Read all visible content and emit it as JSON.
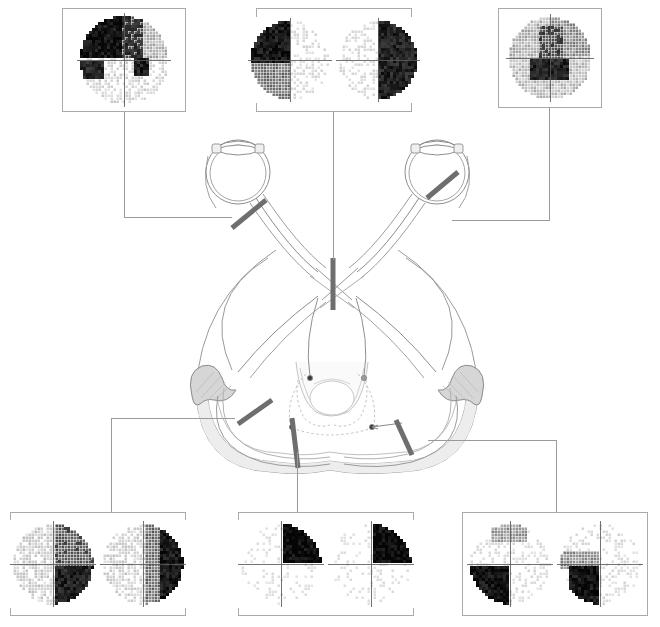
{
  "figure": {
    "background_color": "#ffffff",
    "line_color": "#808080",
    "lesion_color": "#6e6e6e",
    "box_border_color": "#a9a9a9",
    "connector_color": "#9a9a9a",
    "lgn_fill": "#d4d4d4"
  },
  "anatomy": {
    "structures": [
      {
        "name": "left-eye",
        "label": "Left eye"
      },
      {
        "name": "right-eye",
        "label": "Right eye"
      },
      {
        "name": "left-optic-nerve",
        "label": "Left optic nerve"
      },
      {
        "name": "right-optic-nerve",
        "label": "Right optic nerve"
      },
      {
        "name": "optic-chiasm",
        "label": "Optic chiasm"
      },
      {
        "name": "left-optic-tract",
        "label": "Left optic tract"
      },
      {
        "name": "right-optic-tract",
        "label": "Right optic tract"
      },
      {
        "name": "left-lateral-geniculate-nucleus",
        "label": "Left LGN"
      },
      {
        "name": "right-lateral-geniculate-nucleus",
        "label": "Right LGN"
      },
      {
        "name": "left-optic-radiation",
        "label": "Left optic radiation"
      },
      {
        "name": "right-optic-radiation",
        "label": "Right optic radiation"
      },
      {
        "name": "midbrain",
        "label": "Midbrain"
      },
      {
        "name": "occipital-cortex",
        "label": "Occipital cortex"
      },
      {
        "name": "pretectal-nucleus-left",
        "label": "Left pretectal nucleus"
      },
      {
        "name": "pretectal-nucleus-right",
        "label": "Right pretectal nucleus"
      }
    ]
  },
  "lesions": [
    {
      "id": "lesion-1",
      "site": "left-optic-nerve",
      "defect": "left-monocular-field-loss"
    },
    {
      "id": "lesion-2",
      "site": "optic-chiasm",
      "defect": "bitemporal-hemianopia"
    },
    {
      "id": "lesion-3",
      "site": "right-optic-nerve",
      "defect": "right-monocular-field-loss"
    },
    {
      "id": "lesion-4",
      "site": "left-optic-tract",
      "defect": "right-homonymous-hemianopia"
    },
    {
      "id": "lesion-5",
      "site": "left-temporal-optic-radiation",
      "defect": "right-superior-homonymous-quadrantanopia"
    },
    {
      "id": "lesion-6",
      "site": "right-parietal-optic-radiation",
      "defect": "left-inferior-homonymous-quadrantanopia"
    }
  ],
  "field_boxes": [
    {
      "id": "vf-top-left",
      "name": "visual-field-left-optic-nerve-lesion",
      "lesion_ref": "lesion-1",
      "x": 62,
      "y": 8,
      "width": 124,
      "height": 104,
      "eyes": [
        {
          "eye": "left",
          "pattern": "superior-altitudinal-arcuate",
          "size": 96
        }
      ]
    },
    {
      "id": "vf-top-center",
      "name": "visual-field-chiasm-lesion",
      "lesion_ref": "lesion-2",
      "x": 256,
      "y": 8,
      "width": 156,
      "height": 104,
      "eyes": [
        {
          "eye": "left",
          "pattern": "temporal-left-hemi",
          "size": 86
        },
        {
          "eye": "right",
          "pattern": "temporal-right-hemi",
          "size": 86
        }
      ]
    },
    {
      "id": "vf-top-right",
      "name": "visual-field-right-optic-nerve-lesion",
      "lesion_ref": "lesion-3",
      "x": 498,
      "y": 8,
      "width": 104,
      "height": 100,
      "eyes": [
        {
          "eye": "right",
          "pattern": "central-patchy-scotoma",
          "size": 90
        }
      ]
    },
    {
      "id": "vf-bottom-left",
      "name": "visual-field-optic-tract-lesion",
      "lesion_ref": "lesion-4",
      "x": 10,
      "y": 512,
      "width": 176,
      "height": 104,
      "eyes": [
        {
          "eye": "left",
          "pattern": "right-hemi-incongruous",
          "size": 88
        },
        {
          "eye": "right",
          "pattern": "right-hemi-incongruous2",
          "size": 88
        }
      ]
    },
    {
      "id": "vf-bottom-center",
      "name": "visual-field-temporal-radiation-lesion",
      "lesion_ref": "lesion-5",
      "x": 238,
      "y": 512,
      "width": 176,
      "height": 104,
      "eyes": [
        {
          "eye": "left",
          "pattern": "superior-right-quadrant",
          "size": 88
        },
        {
          "eye": "right",
          "pattern": "superior-right-quadrant",
          "size": 88
        }
      ]
    },
    {
      "id": "vf-bottom-right",
      "name": "visual-field-parietal-radiation-lesion",
      "lesion_ref": "lesion-6",
      "x": 462,
      "y": 512,
      "width": 186,
      "height": 104,
      "eyes": [
        {
          "eye": "left",
          "pattern": "inferior-left-quadrant",
          "size": 88
        },
        {
          "eye": "right",
          "pattern": "inferior-left-quadrant2",
          "size": 88
        }
      ]
    }
  ],
  "connectors": [
    {
      "name": "connector-top-left",
      "segments": [
        {
          "type": "v",
          "x": 124,
          "y": 112,
          "length": 105
        },
        {
          "type": "h",
          "x": 124,
          "y": 217,
          "length": 108
        }
      ]
    },
    {
      "name": "connector-top-center",
      "segments": [
        {
          "type": "v",
          "x": 333,
          "y": 112,
          "length": 148
        }
      ]
    },
    {
      "name": "connector-top-right",
      "segments": [
        {
          "type": "v",
          "x": 549,
          "y": 108,
          "length": 112
        },
        {
          "type": "h",
          "x": 452,
          "y": 220,
          "length": 98
        }
      ]
    },
    {
      "name": "connector-bottom-left",
      "segments": [
        {
          "type": "h",
          "x": 111,
          "y": 418,
          "length": 124
        },
        {
          "type": "v",
          "x": 111,
          "y": 418,
          "length": 94
        }
      ]
    },
    {
      "name": "connector-bottom-center",
      "segments": [
        {
          "type": "v",
          "x": 297,
          "y": 452,
          "length": 60
        }
      ]
    },
    {
      "name": "connector-bottom-right",
      "segments": [
        {
          "type": "h",
          "x": 428,
          "y": 440,
          "length": 128
        },
        {
          "type": "v",
          "x": 556,
          "y": 440,
          "length": 72
        }
      ]
    }
  ]
}
